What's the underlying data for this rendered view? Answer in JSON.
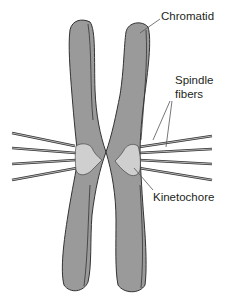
{
  "diagram": {
    "labels": {
      "chromatid": "Chromatid",
      "spindle_fibers_line1": "Spindle",
      "spindle_fibers_line2": "fibers",
      "kinetochore": "Kinetochore"
    },
    "colors": {
      "chromatid_fill": "#9a9a9a",
      "outline": "#333333",
      "kinetochore_fill": "#cfcfcf",
      "fiber_fill": "#b5b5b5",
      "leader_line": "#555555",
      "text": "#231f20"
    },
    "fiber_count_per_side": 4
  }
}
